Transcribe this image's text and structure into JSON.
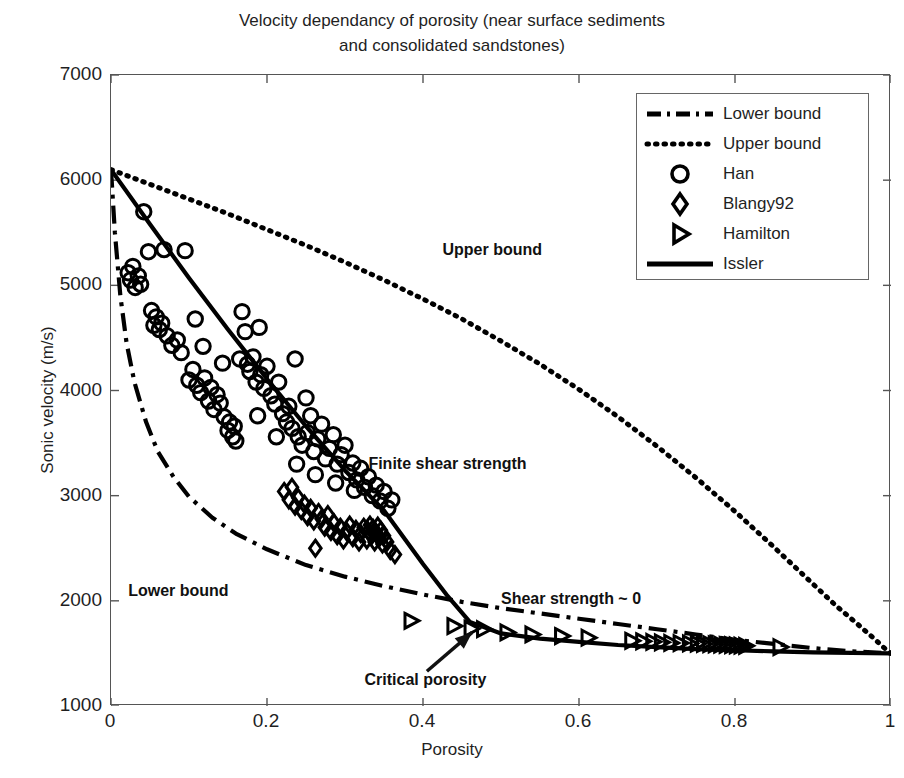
{
  "chart_data": {
    "type": "scatter",
    "title": "Velocity dependancy of porosity (near surface sediments\nand consolidated sandstones)",
    "xlabel": "Porosity",
    "ylabel": "Sonic velocity (m/s)",
    "xlim": [
      0,
      1
    ],
    "ylim": [
      1000,
      7000
    ],
    "xticks": [
      0,
      0.2,
      0.4,
      0.6,
      0.8,
      1
    ],
    "xtick_labels": [
      "0",
      "0.2",
      "0.4",
      "0.6",
      "0.8",
      "1"
    ],
    "yticks": [
      1000,
      2000,
      3000,
      4000,
      5000,
      6000,
      7000
    ],
    "ytick_labels": [
      "1000",
      "2000",
      "3000",
      "4000",
      "5000",
      "6000",
      "7000"
    ],
    "grid": false,
    "legend_position": "upper right",
    "series": [
      {
        "name": "Lower bound",
        "type": "line",
        "style": "dashdot",
        "color": "#000000",
        "points": [
          [
            0.0,
            6100
          ],
          [
            0.005,
            5500
          ],
          [
            0.012,
            4900
          ],
          [
            0.02,
            4450
          ],
          [
            0.03,
            4080
          ],
          [
            0.045,
            3700
          ],
          [
            0.06,
            3420
          ],
          [
            0.08,
            3180
          ],
          [
            0.1,
            2990
          ],
          [
            0.13,
            2790
          ],
          [
            0.16,
            2640
          ],
          [
            0.2,
            2490
          ],
          [
            0.25,
            2340
          ],
          [
            0.3,
            2230
          ],
          [
            0.35,
            2140
          ],
          [
            0.4,
            2060
          ],
          [
            0.45,
            1990
          ],
          [
            0.5,
            1930
          ],
          [
            0.55,
            1880
          ],
          [
            0.6,
            1830
          ],
          [
            0.65,
            1780
          ],
          [
            0.7,
            1730
          ],
          [
            0.75,
            1680
          ],
          [
            0.8,
            1630
          ],
          [
            0.85,
            1590
          ],
          [
            0.9,
            1550
          ],
          [
            0.95,
            1520
          ],
          [
            1.0,
            1500
          ]
        ]
      },
      {
        "name": "Upper bound",
        "type": "line",
        "style": "dotted",
        "color": "#000000",
        "points": [
          [
            0.0,
            6100
          ],
          [
            0.05,
            5960
          ],
          [
            0.1,
            5820
          ],
          [
            0.15,
            5680
          ],
          [
            0.2,
            5530
          ],
          [
            0.25,
            5380
          ],
          [
            0.3,
            5220
          ],
          [
            0.35,
            5050
          ],
          [
            0.4,
            4870
          ],
          [
            0.45,
            4680
          ],
          [
            0.5,
            4470
          ],
          [
            0.55,
            4250
          ],
          [
            0.6,
            4010
          ],
          [
            0.65,
            3750
          ],
          [
            0.7,
            3470
          ],
          [
            0.75,
            3170
          ],
          [
            0.8,
            2850
          ],
          [
            0.85,
            2510
          ],
          [
            0.9,
            2160
          ],
          [
            0.93,
            1950
          ],
          [
            0.96,
            1760
          ],
          [
            0.98,
            1630
          ],
          [
            0.99,
            1560
          ],
          [
            1.0,
            1500
          ]
        ]
      },
      {
        "name": "Issler",
        "type": "line",
        "style": "solid",
        "color": "#000000",
        "points": [
          [
            0.0,
            6100
          ],
          [
            0.05,
            5580
          ],
          [
            0.1,
            5070
          ],
          [
            0.15,
            4580
          ],
          [
            0.2,
            4110
          ],
          [
            0.25,
            3660
          ],
          [
            0.3,
            3240
          ],
          [
            0.35,
            2860
          ],
          [
            0.4,
            2350
          ],
          [
            0.43,
            2060
          ],
          [
            0.46,
            1800
          ],
          [
            0.5,
            1690
          ],
          [
            0.55,
            1640
          ],
          [
            0.6,
            1610
          ],
          [
            0.65,
            1580
          ],
          [
            0.7,
            1560
          ],
          [
            0.75,
            1540
          ],
          [
            0.8,
            1530
          ],
          [
            0.85,
            1520
          ],
          [
            0.9,
            1510
          ],
          [
            0.95,
            1505
          ],
          [
            1.0,
            1500
          ]
        ]
      },
      {
        "name": "Han",
        "type": "scatter",
        "marker": "circle",
        "color": "#000000",
        "points": [
          [
            0.022,
            5120
          ],
          [
            0.025,
            5050
          ],
          [
            0.028,
            5180
          ],
          [
            0.031,
            4980
          ],
          [
            0.035,
            5090
          ],
          [
            0.038,
            5010
          ],
          [
            0.042,
            5700
          ],
          [
            0.048,
            5320
          ],
          [
            0.052,
            4760
          ],
          [
            0.055,
            4620
          ],
          [
            0.058,
            4700
          ],
          [
            0.062,
            4580
          ],
          [
            0.065,
            4640
          ],
          [
            0.068,
            5340
          ],
          [
            0.072,
            4520
          ],
          [
            0.078,
            4430
          ],
          [
            0.085,
            4480
          ],
          [
            0.09,
            4360
          ],
          [
            0.095,
            5330
          ],
          [
            0.1,
            4100
          ],
          [
            0.105,
            4200
          ],
          [
            0.11,
            4050
          ],
          [
            0.115,
            3980
          ],
          [
            0.12,
            4120
          ],
          [
            0.125,
            3900
          ],
          [
            0.128,
            4030
          ],
          [
            0.132,
            3820
          ],
          [
            0.136,
            3960
          ],
          [
            0.14,
            3880
          ],
          [
            0.145,
            3750
          ],
          [
            0.15,
            3620
          ],
          [
            0.152,
            3700
          ],
          [
            0.156,
            3560
          ],
          [
            0.16,
            3520
          ],
          [
            0.165,
            4300
          ],
          [
            0.168,
            4750
          ],
          [
            0.172,
            4560
          ],
          [
            0.175,
            4250
          ],
          [
            0.178,
            4180
          ],
          [
            0.182,
            4320
          ],
          [
            0.186,
            4080
          ],
          [
            0.19,
            4600
          ],
          [
            0.192,
            4150
          ],
          [
            0.196,
            4020
          ],
          [
            0.2,
            4230
          ],
          [
            0.205,
            3950
          ],
          [
            0.21,
            3870
          ],
          [
            0.215,
            4080
          ],
          [
            0.22,
            3780
          ],
          [
            0.225,
            3700
          ],
          [
            0.228,
            3850
          ],
          [
            0.232,
            3640
          ],
          [
            0.236,
            4300
          ],
          [
            0.24,
            3560
          ],
          [
            0.245,
            3480
          ],
          [
            0.25,
            3930
          ],
          [
            0.252,
            3600
          ],
          [
            0.256,
            3760
          ],
          [
            0.26,
            3420
          ],
          [
            0.265,
            3540
          ],
          [
            0.27,
            3680
          ],
          [
            0.275,
            3350
          ],
          [
            0.28,
            3450
          ],
          [
            0.285,
            3580
          ],
          [
            0.29,
            3300
          ],
          [
            0.295,
            3390
          ],
          [
            0.3,
            3480
          ],
          [
            0.305,
            3220
          ],
          [
            0.31,
            3310
          ],
          [
            0.315,
            3150
          ],
          [
            0.32,
            3260
          ],
          [
            0.325,
            3080
          ],
          [
            0.33,
            3180
          ],
          [
            0.335,
            3000
          ],
          [
            0.34,
            3100
          ],
          [
            0.345,
            2950
          ],
          [
            0.35,
            3040
          ],
          [
            0.355,
            2880
          ],
          [
            0.36,
            2960
          ],
          [
            0.108,
            4680
          ],
          [
            0.118,
            4420
          ],
          [
            0.143,
            4260
          ],
          [
            0.158,
            3660
          ],
          [
            0.188,
            3760
          ],
          [
            0.212,
            3560
          ],
          [
            0.238,
            3300
          ],
          [
            0.262,
            3200
          ],
          [
            0.288,
            3120
          ],
          [
            0.312,
            3050
          ]
        ]
      },
      {
        "name": "Blangy92",
        "type": "scatter",
        "marker": "diamond",
        "color": "#000000",
        "points": [
          [
            0.222,
            3040
          ],
          [
            0.228,
            2960
          ],
          [
            0.232,
            3080
          ],
          [
            0.236,
            2900
          ],
          [
            0.24,
            2980
          ],
          [
            0.244,
            2860
          ],
          [
            0.248,
            2920
          ],
          [
            0.252,
            2800
          ],
          [
            0.256,
            2880
          ],
          [
            0.26,
            2760
          ],
          [
            0.262,
            2500
          ],
          [
            0.266,
            2840
          ],
          [
            0.27,
            2780
          ],
          [
            0.274,
            2700
          ],
          [
            0.278,
            2820
          ],
          [
            0.282,
            2660
          ],
          [
            0.286,
            2740
          ],
          [
            0.29,
            2620
          ],
          [
            0.294,
            2700
          ],
          [
            0.298,
            2580
          ],
          [
            0.302,
            2660
          ],
          [
            0.306,
            2720
          ],
          [
            0.31,
            2600
          ],
          [
            0.314,
            2680
          ],
          [
            0.318,
            2560
          ],
          [
            0.32,
            2640
          ],
          [
            0.324,
            2700
          ],
          [
            0.328,
            2580
          ],
          [
            0.33,
            2660
          ],
          [
            0.332,
            2720
          ],
          [
            0.334,
            2620
          ],
          [
            0.336,
            2690
          ],
          [
            0.338,
            2560
          ],
          [
            0.34,
            2640
          ],
          [
            0.342,
            2710
          ],
          [
            0.344,
            2600
          ],
          [
            0.346,
            2670
          ],
          [
            0.348,
            2540
          ],
          [
            0.35,
            2620
          ],
          [
            0.354,
            2560
          ],
          [
            0.358,
            2480
          ],
          [
            0.364,
            2440
          ]
        ]
      },
      {
        "name": "Hamilton",
        "type": "scatter",
        "marker": "triangle-right",
        "color": "#000000",
        "points": [
          [
            0.385,
            1810
          ],
          [
            0.44,
            1760
          ],
          [
            0.462,
            1735
          ],
          [
            0.478,
            1730
          ],
          [
            0.508,
            1700
          ],
          [
            0.54,
            1680
          ],
          [
            0.578,
            1665
          ],
          [
            0.612,
            1650
          ],
          [
            0.668,
            1620
          ],
          [
            0.682,
            1615
          ],
          [
            0.695,
            1610
          ],
          [
            0.706,
            1605
          ],
          [
            0.718,
            1600
          ],
          [
            0.73,
            1598
          ],
          [
            0.742,
            1595
          ],
          [
            0.752,
            1592
          ],
          [
            0.76,
            1590
          ],
          [
            0.768,
            1588
          ],
          [
            0.775,
            1585
          ],
          [
            0.782,
            1583
          ],
          [
            0.789,
            1580
          ],
          [
            0.796,
            1578
          ],
          [
            0.802,
            1576
          ],
          [
            0.808,
            1574
          ],
          [
            0.814,
            1572
          ],
          [
            0.858,
            1560
          ]
        ]
      }
    ],
    "annotations": [
      {
        "name": "upper-bound-label",
        "text": "Upper bound",
        "x": 0.425,
        "y": 5330
      },
      {
        "name": "lower-bound-label",
        "text": "Lower bound",
        "x": 0.022,
        "y": 2080
      },
      {
        "name": "finite-shear-strength-label",
        "text": "Finite shear strength",
        "x": 0.33,
        "y": 3290
      },
      {
        "name": "shear-strength-zero-label",
        "text": "Shear strength ~ 0",
        "x": 0.5,
        "y": 2010
      },
      {
        "name": "critical-porosity-label",
        "text": "Critical porosity",
        "x": 0.325,
        "y": 1240
      }
    ]
  },
  "legend": {
    "items": [
      {
        "label": "Lower bound",
        "marker": "dashdot-line"
      },
      {
        "label": "Upper bound",
        "marker": "dotted-line"
      },
      {
        "label": "Han",
        "marker": "circle"
      },
      {
        "label": "Blangy92",
        "marker": "diamond"
      },
      {
        "label": "Hamilton",
        "marker": "triangle-right"
      },
      {
        "label": "Issler",
        "marker": "solid-line"
      }
    ]
  }
}
